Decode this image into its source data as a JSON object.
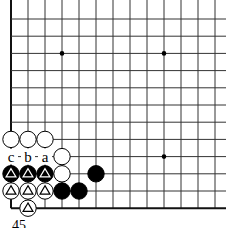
{
  "diagram": {
    "type": "go-board-fragment",
    "grid": {
      "origin_x": 11,
      "origin_y": 19,
      "spacing_x": 17,
      "spacing_y": 17.2,
      "cols": 13,
      "rows": 12,
      "left_edge": true,
      "bottom_edge": true,
      "line_color": "#333333",
      "edge_color": "#111111"
    },
    "star_points": [
      {
        "col": 3,
        "row": 2
      },
      {
        "col": 9,
        "row": 2
      },
      {
        "col": 9,
        "row": 8
      }
    ],
    "stones": [
      {
        "color": "white",
        "col": 0,
        "row": 7,
        "mark": ""
      },
      {
        "color": "white",
        "col": 1,
        "row": 7,
        "mark": ""
      },
      {
        "color": "white",
        "col": 2,
        "row": 7,
        "mark": ""
      },
      {
        "color": "white",
        "col": 3,
        "row": 8,
        "mark": ""
      },
      {
        "color": "black",
        "col": 0,
        "row": 9,
        "mark": "triangle"
      },
      {
        "color": "black",
        "col": 1,
        "row": 9,
        "mark": "triangle"
      },
      {
        "color": "black",
        "col": 2,
        "row": 9,
        "mark": "triangle"
      },
      {
        "color": "white",
        "col": 3,
        "row": 9,
        "mark": ""
      },
      {
        "color": "black",
        "col": 5,
        "row": 9,
        "mark": ""
      },
      {
        "color": "white",
        "col": 0,
        "row": 10,
        "mark": "triangle"
      },
      {
        "color": "white",
        "col": 1,
        "row": 10,
        "mark": "triangle"
      },
      {
        "color": "white",
        "col": 2,
        "row": 10,
        "mark": "triangle"
      },
      {
        "color": "black",
        "col": 3,
        "row": 10,
        "mark": ""
      },
      {
        "color": "black",
        "col": 4,
        "row": 10,
        "mark": ""
      },
      {
        "color": "white",
        "col": 1,
        "row": 11,
        "mark": "triangle"
      }
    ],
    "labels": [
      {
        "text": "c",
        "col": 0,
        "row": 8
      },
      {
        "text": "b",
        "col": 1,
        "row": 8
      },
      {
        "text": "a",
        "col": 2,
        "row": 8
      }
    ],
    "caption": "45"
  }
}
